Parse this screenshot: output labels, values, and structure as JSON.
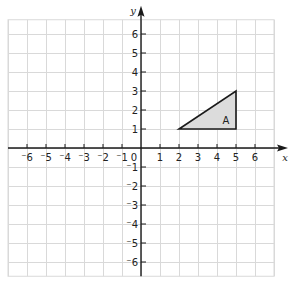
{
  "chart_data": {
    "type": "coordinate-plane",
    "xlabel": "x",
    "ylabel": "y",
    "xlim": [
      -7,
      7
    ],
    "ylim": [
      -6.75,
      6.75
    ],
    "x_ticks": [
      -6,
      -5,
      -4,
      -3,
      -2,
      -1,
      1,
      2,
      3,
      4,
      5,
      6
    ],
    "y_ticks": [
      -6,
      -5,
      -4,
      -3,
      -2,
      -1,
      1,
      2,
      3,
      4,
      5,
      6
    ],
    "origin_label": "0",
    "grid": true,
    "shapes": [
      {
        "name": "triangle-A",
        "label": "A",
        "vertices": [
          [
            2,
            1
          ],
          [
            5,
            1
          ],
          [
            5,
            3
          ]
        ],
        "fill": "#dcdcdc",
        "stroke": "#1a1a1a",
        "label_position": [
          4.5,
          1.5
        ]
      }
    ]
  },
  "labels": {
    "x_axis": "x",
    "y_axis": "y",
    "origin": "0",
    "triangle": "A",
    "x_ticks": [
      "⁻6",
      "⁻5",
      "⁻4",
      "⁻3",
      "⁻2",
      "⁻1",
      "1",
      "2",
      "3",
      "4",
      "5",
      "6"
    ],
    "y_ticks_pos": [
      "1",
      "2",
      "3",
      "4",
      "5",
      "6"
    ],
    "y_ticks_neg": [
      "⁻1",
      "⁻2",
      "⁻3",
      "⁻4",
      "⁻5",
      "⁻6"
    ]
  },
  "colors": {
    "grid": "#d9d9d9",
    "axis": "#1a1a1a",
    "triangle_fill": "#dcdcdc"
  }
}
